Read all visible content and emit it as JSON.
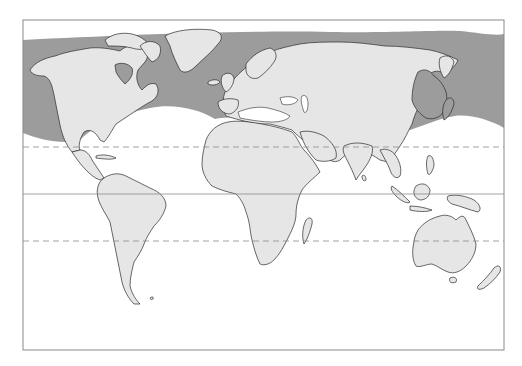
{
  "map": {
    "type": "world-map",
    "projection": "cylindrical (Miller-like)",
    "frame": {
      "x": 23,
      "y": 20,
      "width": 481,
      "height": 330,
      "stroke": "#8a8a8a"
    },
    "colors": {
      "background": "#ffffff",
      "land": "#e6e6e6",
      "shaded_region": "#9c9c9c",
      "coastline": "#2a2a2a",
      "grid_lines": "#8a8a8a"
    },
    "reference_lines": [
      {
        "name": "tropic-of-cancer",
        "style": "dashed",
        "y": 147
      },
      {
        "name": "equator",
        "style": "solid",
        "y": 194
      },
      {
        "name": "tropic-of-capricorn",
        "style": "dashed",
        "y": 241
      }
    ],
    "shaded_band": {
      "description": "Shaded band across northern mid/high latitudes over ocean and parts of land (Canada east, Europe coasts, East Asia/Japan)",
      "top_edge_y_range": [
        34,
        40
      ],
      "bottom_edge_left_y": 133,
      "bottom_edge_mid_y": 112,
      "bottom_edge_right_y": 128
    },
    "labels": []
  }
}
